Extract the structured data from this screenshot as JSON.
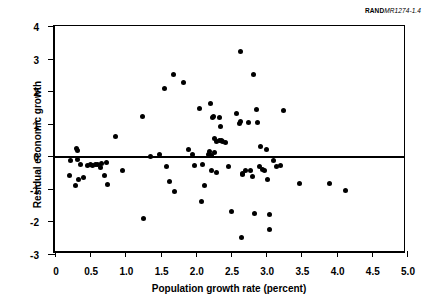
{
  "source_note": {
    "brand": "RAND",
    "code": "MR1274-1.4"
  },
  "chart_data": {
    "type": "scatter",
    "title": "",
    "xlabel": "Population growth rate (percent)",
    "ylabel": "Residual economic growth",
    "xlim": [
      0,
      5.0
    ],
    "ylim": [
      -3,
      4
    ],
    "xticks": [
      "0",
      "0.5",
      "1.0",
      "1.5",
      "2.0",
      "2.5",
      "3.0",
      "3.5",
      "4.0",
      "4.5",
      "5.0"
    ],
    "xtick_values": [
      0,
      0.5,
      1.0,
      1.5,
      2.0,
      2.5,
      3.0,
      3.5,
      4.0,
      4.5,
      5.0
    ],
    "yticks": [
      "4",
      "3",
      "2",
      "1",
      "0",
      "-1",
      "-2",
      "-3"
    ],
    "ytick_values": [
      4,
      3,
      2,
      1,
      0,
      -1,
      -2,
      -3
    ],
    "grid": false,
    "legend": false,
    "reference_lines": [
      {
        "axis": "y",
        "value": 0,
        "style": "solid",
        "color": "#000000"
      }
    ],
    "marker": {
      "shape": "circle",
      "color": "#000000",
      "size": 5
    },
    "points": [
      [
        0.2,
        -0.58
      ],
      [
        0.22,
        -0.13
      ],
      [
        0.29,
        -0.9
      ],
      [
        0.31,
        0.25
      ],
      [
        0.32,
        0.18
      ],
      [
        0.32,
        -0.1
      ],
      [
        0.33,
        -0.7
      ],
      [
        0.36,
        -0.25
      ],
      [
        0.41,
        -0.65
      ],
      [
        0.46,
        -0.28
      ],
      [
        0.5,
        -0.26
      ],
      [
        0.53,
        -0.27
      ],
      [
        0.57,
        -0.26
      ],
      [
        0.6,
        -0.25
      ],
      [
        0.64,
        -0.35
      ],
      [
        0.66,
        -0.22
      ],
      [
        0.7,
        -0.6
      ],
      [
        0.73,
        -0.2
      ],
      [
        0.75,
        -0.88
      ],
      [
        0.86,
        0.6
      ],
      [
        0.96,
        -0.43
      ],
      [
        1.24,
        1.23
      ],
      [
        1.25,
        -1.92
      ],
      [
        1.35,
        -0.02
      ],
      [
        1.49,
        0.07
      ],
      [
        1.56,
        2.08
      ],
      [
        1.58,
        -0.3
      ],
      [
        1.62,
        -0.77
      ],
      [
        1.68,
        2.52
      ],
      [
        1.7,
        -1.09
      ],
      [
        1.83,
        2.28
      ],
      [
        1.89,
        0.21
      ],
      [
        1.95,
        0.07
      ],
      [
        1.98,
        -0.27
      ],
      [
        2.05,
        1.47
      ],
      [
        2.08,
        -1.4
      ],
      [
        2.1,
        -0.25
      ],
      [
        2.12,
        -0.91
      ],
      [
        2.18,
        0.06
      ],
      [
        2.19,
        0.02
      ],
      [
        2.2,
        0.15
      ],
      [
        2.21,
        1.62
      ],
      [
        2.22,
        -0.45
      ],
      [
        2.23,
        0.03
      ],
      [
        2.24,
        1.18
      ],
      [
        2.25,
        1.22
      ],
      [
        2.26,
        0.55
      ],
      [
        2.27,
        0.13
      ],
      [
        2.29,
        0.44
      ],
      [
        2.3,
        -0.5
      ],
      [
        2.33,
        1.19
      ],
      [
        2.34,
        0.49
      ],
      [
        2.35,
        0.9
      ],
      [
        2.36,
        0.47
      ],
      [
        2.38,
        0.45
      ],
      [
        2.42,
        0.42
      ],
      [
        2.47,
        -0.3
      ],
      [
        2.5,
        -1.7
      ],
      [
        2.58,
        1.32
      ],
      [
        2.62,
        1.0
      ],
      [
        2.63,
        3.23
      ],
      [
        2.64,
        1.07
      ],
      [
        2.65,
        -2.5
      ],
      [
        2.66,
        -0.52
      ],
      [
        2.67,
        -0.55
      ],
      [
        2.7,
        -0.43
      ],
      [
        2.75,
        1.05
      ],
      [
        2.78,
        -0.44
      ],
      [
        2.8,
        -0.63
      ],
      [
        2.82,
        2.5
      ],
      [
        2.84,
        -1.77
      ],
      [
        2.86,
        1.45
      ],
      [
        2.88,
        1.05
      ],
      [
        2.9,
        -0.3
      ],
      [
        2.92,
        0.3
      ],
      [
        2.95,
        -0.42
      ],
      [
        2.98,
        -0.45
      ],
      [
        3.0,
        0.2
      ],
      [
        3.02,
        -0.7
      ],
      [
        3.04,
        -1.8
      ],
      [
        3.05,
        -2.25
      ],
      [
        3.1,
        -0.12
      ],
      [
        3.14,
        -0.3
      ],
      [
        3.2,
        -0.28
      ],
      [
        3.24,
        1.4
      ],
      [
        3.47,
        -0.85
      ],
      [
        3.9,
        -0.84
      ],
      [
        4.12,
        -1.06
      ]
    ],
    "n_points": 88
  }
}
